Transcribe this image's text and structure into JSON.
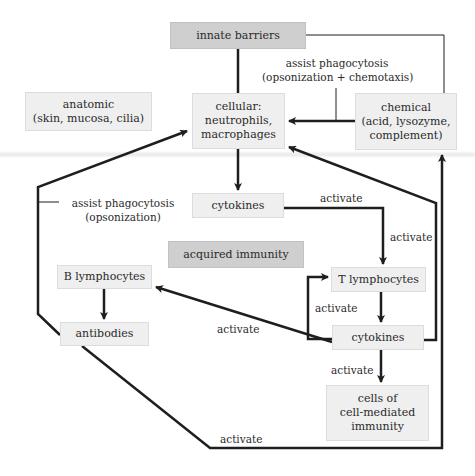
{
  "nodes": {
    "innate_barriers": "innate barriers",
    "anatomic": [
      "anatomic",
      "(skin, mucosa, cilia)"
    ],
    "cellular": [
      "cellular:",
      "neutrophils,",
      "macrophages"
    ],
    "chemical": [
      "chemical",
      "(acid, lysozyme,",
      "complement)"
    ],
    "cytokines_innate": "cytokines",
    "acquired_immunity": "acquired immunity",
    "b_lymphocytes": "B lymphocytes",
    "t_lymphocytes": "T lymphocytes",
    "antibodies": "antibodies",
    "cytokines_acquired": "cytokines",
    "cell_mediated": [
      "cells of",
      "cell-mediated",
      "immunity"
    ]
  },
  "edge_labels": {
    "chemical_to_cellular": [
      "assist phagocytosis",
      "(opsonization + chemotaxis)"
    ],
    "antibodies_to_cellular": [
      "assist phagocytosis",
      "(opsonization)"
    ],
    "cytokines_to_t_horizontal": "activate",
    "cytokines_to_t_vertical": "activate",
    "cytokines_feedback_t": "activate",
    "cytokines_to_b": "activate",
    "cytokines_to_cmi": "activate",
    "antibodies_to_chemical": "activate"
  }
}
